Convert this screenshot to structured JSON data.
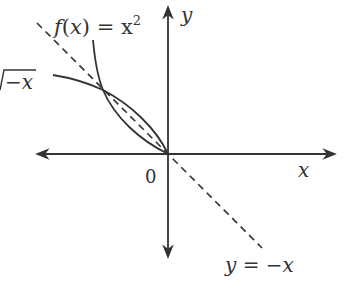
{
  "diagram": {
    "type": "function-graph",
    "axes": {
      "x_label": "x",
      "y_label": "y",
      "origin_label": "0"
    },
    "curves": [
      {
        "name": "parabola",
        "label": "f(x) = x²",
        "label_fn": "f",
        "label_open": "(",
        "label_var": "x",
        "label_close": ")",
        "label_eq": " = x",
        "label_exp": "2",
        "style": "solid"
      },
      {
        "name": "sqrt-neg-x",
        "label": "√−x",
        "label_text": "−x",
        "style": "solid"
      },
      {
        "name": "line-y-neg-x",
        "label": "y = −x",
        "style": "dashed"
      }
    ],
    "colors": {
      "stroke": "#333333",
      "background": "#ffffff"
    }
  }
}
